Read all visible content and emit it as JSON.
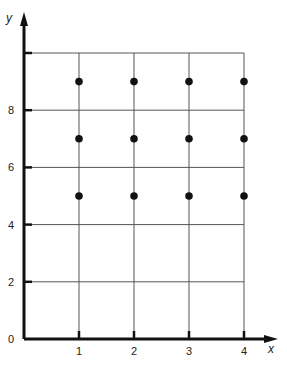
{
  "chart_data": {
    "type": "scatter",
    "title": "",
    "xlabel": "x",
    "ylabel": "y",
    "xlim": [
      0,
      4
    ],
    "ylim": [
      0,
      10
    ],
    "x_ticks": [
      "1",
      "2",
      "3",
      "4"
    ],
    "y_ticks": [
      "0",
      "2",
      "4",
      "6",
      "8"
    ],
    "grid": true,
    "legend": null,
    "series": [
      {
        "name": "points",
        "points": [
          {
            "x": 1,
            "y": 5
          },
          {
            "x": 2,
            "y": 5
          },
          {
            "x": 3,
            "y": 5
          },
          {
            "x": 4,
            "y": 5
          },
          {
            "x": 1,
            "y": 7
          },
          {
            "x": 2,
            "y": 7
          },
          {
            "x": 3,
            "y": 7
          },
          {
            "x": 4,
            "y": 7
          },
          {
            "x": 1,
            "y": 9
          },
          {
            "x": 2,
            "y": 9
          },
          {
            "x": 3,
            "y": 9
          },
          {
            "x": 4,
            "y": 9
          }
        ]
      }
    ]
  },
  "colors": {
    "axis": "#111111",
    "grid": "#555555",
    "point": "#111111"
  }
}
